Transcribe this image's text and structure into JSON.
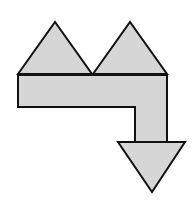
{
  "diagram": {
    "fill_color": "#d6d6d6",
    "stroke_color": "#111111",
    "shapes": [
      {
        "name": "left-triangle",
        "points": "18,74 55,22 92,74"
      },
      {
        "name": "right-triangle",
        "points": "93,74 130,22 167,74"
      },
      {
        "name": "l-bar",
        "points": "18,75 167,75 167,142 135,142 135,107 18,107"
      },
      {
        "name": "down-triangle",
        "points": "118,142 185,142 152,192"
      }
    ]
  }
}
